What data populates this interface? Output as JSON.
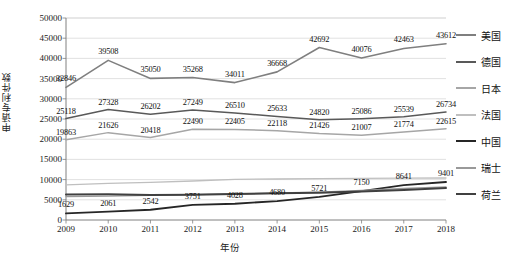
{
  "chart_data": {
    "type": "line",
    "title": "",
    "xlabel": "年份",
    "ylabel": "申请专利件数",
    "x": [
      2009,
      2010,
      2011,
      2012,
      2013,
      2014,
      2015,
      2016,
      2017,
      2018
    ],
    "xtick_labels": [
      "2009",
      "2010",
      "2011",
      "2012",
      "2013",
      "2014",
      "2015",
      "2016",
      "2017",
      "2018"
    ],
    "ytick_labels": [
      "0",
      "5000",
      "10000",
      "15000",
      "20000",
      "25000",
      "30000",
      "35000",
      "40000",
      "45000",
      "50000"
    ],
    "ylim": [
      0,
      50000
    ],
    "ytick_step": 5000,
    "grid": true,
    "legend_position": "right",
    "series": [
      {
        "name": "美国",
        "color": "#7f7f7f",
        "width": 1.6,
        "values": [
          32846,
          39508,
          35050,
          35268,
          34011,
          36668,
          42692,
          40076,
          42463,
          43612
        ],
        "labels": [
          "32846",
          "39508",
          "35050",
          "35268",
          "34011",
          "36668",
          "42692",
          "40076",
          "42463",
          "43612"
        ],
        "labeled": true
      },
      {
        "name": "德国",
        "color": "#595959",
        "width": 1.5,
        "values": [
          25118,
          27328,
          26202,
          27249,
          26510,
          25633,
          24820,
          25086,
          25539,
          26734
        ],
        "labels": [
          "25118",
          "27328",
          "26202",
          "27249",
          "26510",
          "25633",
          "24820",
          "25086",
          "25539",
          "26734"
        ],
        "labeled": true
      },
      {
        "name": "日本",
        "color": "#a6a6a6",
        "width": 1.5,
        "values": [
          19863,
          21626,
          20418,
          22490,
          22405,
          22118,
          21426,
          21007,
          21774,
          22615
        ],
        "labels": [
          "19863",
          "21626",
          "20418",
          "22490",
          "22405",
          "22118",
          "21426",
          "21007",
          "21774",
          "22615"
        ],
        "labeled": true
      },
      {
        "name": "法国",
        "color": "#bfbfbf",
        "width": 1.3,
        "values": [
          8700,
          9050,
          9300,
          9650,
          10050,
          10150,
          10250,
          10300,
          10350,
          10400
        ],
        "labels": [],
        "labeled": false
      },
      {
        "name": "中国",
        "color": "#262626",
        "width": 1.9,
        "values": [
          1629,
          2061,
          2542,
          3751,
          4028,
          4680,
          5721,
          7150,
          8641,
          9401
        ],
        "labels": [
          "1629",
          "2061",
          "2542",
          "3751",
          "4028",
          "4680",
          "5721",
          "7150",
          "8641",
          "9401"
        ],
        "labeled": true
      },
      {
        "name": "瑞士",
        "color": "#999999",
        "width": 1.3,
        "values": [
          5800,
          5900,
          6100,
          6300,
          6500,
          6700,
          6900,
          7300,
          7800,
          8200
        ],
        "labels": [],
        "labeled": false
      },
      {
        "name": "荷兰",
        "color": "#404040",
        "width": 2.0,
        "values": [
          6300,
          6350,
          6200,
          6250,
          6450,
          6600,
          6750,
          7050,
          7450,
          7900
        ],
        "labels": [],
        "labeled": false
      }
    ]
  }
}
